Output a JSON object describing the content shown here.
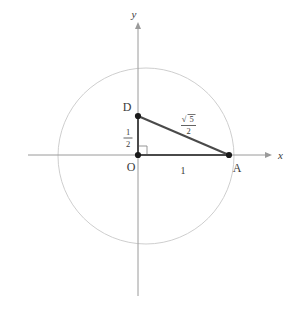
{
  "figure": {
    "background_color": "#ffffff"
  },
  "colors": {
    "axis": "#9a9a9a",
    "circle": "#c8c8c8",
    "triangle": "#4a4a4a",
    "point": "#1a1a1a",
    "text": "#3a3a3a",
    "right_angle": "#8a8a8a"
  },
  "axes": {
    "x_label": "x",
    "y_label": "y",
    "x_axis": {
      "x1": 28,
      "y1": 155,
      "x2": 272,
      "y2": 155
    },
    "y_axis": {
      "x1": 138,
      "y1": 22,
      "x2": 138,
      "y2": 296
    },
    "x_label_pos": {
      "x": 278,
      "y": 159
    },
    "y_label_pos": {
      "x": 134,
      "y": 18
    }
  },
  "circle": {
    "cx": 146,
    "cy": 156,
    "r": 88,
    "stroke_width": 0.9
  },
  "points": [
    {
      "id": "O",
      "label": "O",
      "x": 138,
      "y": 155,
      "label_x": 131,
      "label_y": 170,
      "dot": true,
      "radius": 3.1
    },
    {
      "id": "D",
      "label": "D",
      "x": 138,
      "y": 116,
      "label_x": 127,
      "label_y": 110,
      "dot": true,
      "radius": 3.1
    },
    {
      "id": "A",
      "label": "A",
      "x": 229,
      "y": 155,
      "label_x": 234,
      "label_y": 171,
      "dot": true,
      "radius": 3.1
    }
  ],
  "segments": [
    {
      "id": "OD",
      "x1": 138,
      "y1": 155,
      "x2": 138,
      "y2": 116,
      "width": 2.0
    },
    {
      "id": "OA",
      "x1": 138,
      "y1": 155,
      "x2": 229,
      "y2": 155,
      "width": 2.0
    },
    {
      "id": "DA",
      "x1": 138,
      "y1": 116,
      "x2": 229,
      "y2": 155,
      "width": 2.0
    }
  ],
  "right_angle": {
    "at": "O",
    "path": "M 138 146 L 147 146 L 147 155",
    "size": 9
  },
  "measures": [
    {
      "id": "OD-length",
      "type": "fraction",
      "numerator": "1",
      "denominator": "2",
      "x": 128,
      "y": 137
    },
    {
      "id": "OA-length",
      "type": "plain",
      "text": "1",
      "x": 183,
      "y": 173
    },
    {
      "id": "DA-length",
      "type": "radical-fraction",
      "radical_symbol": "√",
      "radicand": "5",
      "denominator": "2",
      "x": 189,
      "y": 123
    }
  ],
  "arrows": {
    "x_arrow": {
      "tip_x": 272,
      "tip_y": 155,
      "size": 4
    },
    "y_arrow": {
      "tip_x": 138,
      "tip_y": 22,
      "size": 4
    }
  }
}
